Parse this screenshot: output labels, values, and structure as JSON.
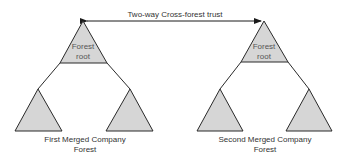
{
  "trust": {
    "label": "Two-way Cross-forest trust"
  },
  "forests": [
    {
      "root_label_line1": "Forest",
      "root_label_line2": "root",
      "caption_line1": "First Merged Company",
      "caption_line2": "Forest"
    },
    {
      "root_label_line1": "Forest",
      "root_label_line2": "root",
      "caption_line1": "Second Merged Company",
      "caption_line2": "Forest"
    }
  ],
  "colors": {
    "fill": "#d6d6d6",
    "stroke": "#2a2a2a"
  }
}
